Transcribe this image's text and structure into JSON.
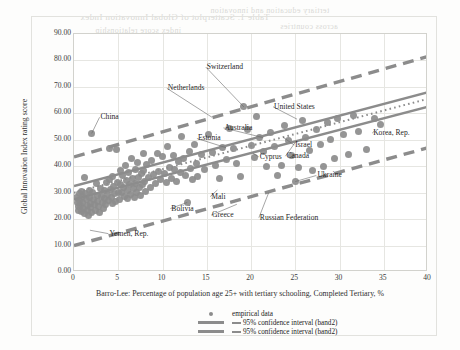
{
  "chart_data": {
    "type": "scatter",
    "title": "",
    "xlabel": "Barro-Lee: Percentage of population age 25+ with tertiary schooling, Completed Tertiary, %",
    "ylabel": "Global Innovation Index rating score",
    "xlim": [
      0,
      40
    ],
    "ylim": [
      0,
      90
    ],
    "xticks": [
      "0",
      "5",
      "10",
      "15",
      "20",
      "25",
      "30",
      "35",
      "40"
    ],
    "yticks": [
      "0.00",
      "10.00",
      "20.00",
      "30.00",
      "40.00",
      "50.00",
      "60.00",
      "70.00",
      "80.00",
      "90.00"
    ],
    "grid": true,
    "legend_position": "bottom-center",
    "marker_color": "#8c8c8c",
    "line_color": "#8c8c8c",
    "legend": [
      {
        "key": "dot",
        "label": "empirical data"
      },
      {
        "key": "line",
        "label": "95% confidence interval (band2)"
      },
      {
        "key": "line",
        "label": "95% confidence interval (band2)"
      }
    ],
    "series": [
      {
        "name": "empirical data",
        "type": "scatter",
        "points": [
          [
            0.3,
            28.0
          ],
          [
            0.4,
            26.2
          ],
          [
            0.5,
            24.6
          ],
          [
            0.5,
            23.4
          ],
          [
            0.6,
            29.5
          ],
          [
            0.6,
            27.1
          ],
          [
            0.7,
            25.3
          ],
          [
            0.8,
            22.8
          ],
          [
            0.9,
            30.4
          ],
          [
            1.0,
            28.6
          ],
          [
            1.0,
            26.4
          ],
          [
            1.1,
            24.1
          ],
          [
            1.2,
            22.2
          ],
          [
            1.2,
            35.6
          ],
          [
            1.3,
            29.8
          ],
          [
            1.4,
            27.3
          ],
          [
            1.5,
            25.0
          ],
          [
            1.5,
            23.2
          ],
          [
            1.6,
            21.3
          ],
          [
            1.7,
            31.0
          ],
          [
            1.8,
            28.2
          ],
          [
            1.9,
            26.0
          ],
          [
            1.9,
            24.4
          ],
          [
            2.0,
            22.6
          ],
          [
            2.0,
            52.4
          ],
          [
            2.1,
            30.1
          ],
          [
            2.2,
            27.6
          ],
          [
            2.3,
            25.5
          ],
          [
            2.4,
            23.1
          ],
          [
            2.5,
            33.3
          ],
          [
            2.6,
            29.0
          ],
          [
            2.7,
            26.8
          ],
          [
            2.8,
            24.9
          ],
          [
            2.9,
            22.4
          ],
          [
            3.0,
            31.6
          ],
          [
            3.1,
            28.4
          ],
          [
            3.2,
            26.1
          ],
          [
            3.3,
            24.2
          ],
          [
            3.4,
            30.8
          ],
          [
            3.5,
            27.9
          ],
          [
            3.6,
            25.6
          ],
          [
            3.7,
            33.8
          ],
          [
            3.8,
            29.2
          ],
          [
            3.9,
            26.9
          ],
          [
            4.0,
            35.1
          ],
          [
            4.0,
            46.6
          ],
          [
            4.1,
            31.2
          ],
          [
            4.2,
            28.1
          ],
          [
            4.3,
            25.9
          ],
          [
            4.4,
            36.0
          ],
          [
            4.5,
            32.5
          ],
          [
            4.6,
            29.6
          ],
          [
            4.7,
            26.5
          ],
          [
            4.8,
            46.2
          ],
          [
            4.9,
            34.0
          ],
          [
            5.0,
            30.2
          ],
          [
            5.1,
            27.4
          ],
          [
            5.2,
            38.2
          ],
          [
            5.3,
            33.1
          ],
          [
            5.4,
            29.9
          ],
          [
            5.5,
            36.4
          ],
          [
            5.6,
            31.8
          ],
          [
            5.7,
            28.7
          ],
          [
            5.8,
            40.1
          ],
          [
            5.9,
            34.6
          ],
          [
            6.0,
            30.9
          ],
          [
            6.1,
            27.8
          ],
          [
            6.2,
            37.6
          ],
          [
            6.3,
            32.9
          ],
          [
            6.4,
            29.3
          ],
          [
            6.5,
            43.1
          ],
          [
            6.6,
            35.3
          ],
          [
            6.7,
            31.4
          ],
          [
            6.8,
            28.3
          ],
          [
            6.9,
            38.9
          ],
          [
            7.0,
            33.6
          ],
          [
            7.1,
            30.0
          ],
          [
            7.2,
            41.4
          ],
          [
            7.3,
            35.9
          ],
          [
            7.4,
            32.1
          ],
          [
            7.5,
            28.9
          ],
          [
            7.6,
            37.1
          ],
          [
            7.7,
            33.0
          ],
          [
            7.8,
            44.8
          ],
          [
            7.9,
            38.4
          ],
          [
            8.0,
            34.3
          ],
          [
            8.1,
            30.6
          ],
          [
            8.2,
            40.6
          ],
          [
            8.4,
            35.7
          ],
          [
            8.6,
            31.9
          ],
          [
            8.8,
            42.2
          ],
          [
            9.0,
            36.8
          ],
          [
            9.2,
            33.4
          ],
          [
            9.4,
            45.0
          ],
          [
            9.6,
            38.0
          ],
          [
            9.8,
            34.8
          ],
          [
            10.0,
            43.6
          ],
          [
            10.2,
            37.2
          ],
          [
            10.4,
            33.7
          ],
          [
            10.6,
            47.3
          ],
          [
            10.8,
            39.4
          ],
          [
            11.0,
            35.2
          ],
          [
            11.2,
            44.2
          ],
          [
            11.4,
            38.6
          ],
          [
            11.6,
            34.4
          ],
          [
            11.8,
            41.8
          ],
          [
            12.0,
            37.8
          ],
          [
            12.2,
            51.3
          ],
          [
            12.4,
            43.0
          ],
          [
            12.6,
            36.6
          ],
          [
            12.8,
            26.3
          ],
          [
            13.0,
            45.6
          ],
          [
            13.2,
            39.0
          ],
          [
            13.4,
            34.9
          ],
          [
            13.6,
            48.2
          ],
          [
            13.8,
            41.0
          ],
          [
            14.0,
            36.2
          ],
          [
            14.4,
            44.4
          ],
          [
            14.8,
            38.8
          ],
          [
            15.2,
            52.1
          ],
          [
            15.6,
            45.2
          ],
          [
            16.0,
            40.2
          ],
          [
            16.4,
            35.5
          ],
          [
            16.8,
            47.0
          ],
          [
            17.2,
            42.6
          ],
          [
            17.6,
            54.2
          ],
          [
            18.0,
            46.8
          ],
          [
            18.4,
            41.2
          ],
          [
            18.8,
            36.1
          ],
          [
            19.2,
            62.4
          ],
          [
            19.6,
            53.9
          ],
          [
            20.0,
            48.0
          ],
          [
            20.4,
            43.4
          ],
          [
            20.6,
            58.8
          ],
          [
            21.0,
            50.8
          ],
          [
            21.4,
            45.4
          ],
          [
            21.8,
            39.8
          ],
          [
            22.2,
            52.6
          ],
          [
            22.6,
            47.4
          ],
          [
            23.0,
            36.5
          ],
          [
            23.4,
            40.4
          ],
          [
            23.8,
            55.4
          ],
          [
            24.2,
            49.6
          ],
          [
            24.6,
            44.0
          ],
          [
            25.0,
            34.2
          ],
          [
            25.4,
            39.6
          ],
          [
            25.8,
            57.2
          ],
          [
            26.2,
            51.0
          ],
          [
            26.6,
            45.8
          ],
          [
            27.0,
            38.3
          ],
          [
            27.4,
            54.0
          ],
          [
            27.8,
            48.4
          ],
          [
            28.2,
            40.0
          ],
          [
            28.6,
            56.6
          ],
          [
            29.0,
            50.2
          ],
          [
            29.4,
            42.8
          ],
          [
            29.8,
            58.2
          ],
          [
            30.4,
            52.0
          ],
          [
            31.0,
            44.6
          ],
          [
            31.6,
            59.2
          ],
          [
            32.2,
            53.2
          ],
          [
            33.0,
            46.4
          ],
          [
            34.0,
            58.0
          ],
          [
            34.6,
            55.8
          ]
        ]
      },
      {
        "name": "95% confidence interval (band2) upper",
        "type": "line-dashed",
        "x": [
          0,
          40
        ],
        "y": [
          43.5,
          81.5
        ]
      },
      {
        "name": "95% confidence interval (band2) lower",
        "type": "line-dashed",
        "x": [
          0,
          40
        ],
        "y": [
          10.0,
          47.0
        ]
      },
      {
        "name": "confidence band upper solid",
        "type": "line-solid",
        "x": [
          0,
          40
        ],
        "y": [
          32.5,
          68.0
        ]
      },
      {
        "name": "confidence band lower solid",
        "type": "line-solid",
        "x": [
          0,
          40
        ],
        "y": [
          27.5,
          62.5
        ]
      },
      {
        "name": "fitted regression",
        "type": "line-dotted",
        "x": [
          0,
          40
        ],
        "y": [
          30.0,
          65.5
        ]
      }
    ],
    "annotations": [
      {
        "text": "China",
        "x": 3.0,
        "y": 58.5,
        "point_x": 2.0,
        "point_y": 52.4
      },
      {
        "text": "Switzerland",
        "x": 15.0,
        "y": 77.5,
        "point_x": 19.2,
        "point_y": 62.4
      },
      {
        "text": "Netherlands",
        "x": 10.6,
        "y": 69.5,
        "point_x": 15.6,
        "point_y": 58.5
      },
      {
        "text": "United States",
        "x": 22.6,
        "y": 62.5,
        "point_x": 25.2,
        "point_y": 57.8
      },
      {
        "text": "Australia",
        "x": 17.0,
        "y": 54.5,
        "point_x": 21.4,
        "point_y": 50.8
      },
      {
        "text": "Estonia",
        "x": 14.0,
        "y": 50.5,
        "point_x": 17.2,
        "point_y": 47.0
      },
      {
        "text": "Israel",
        "x": 25.0,
        "y": 48.0,
        "point_x": 23.6,
        "point_y": 51.0
      },
      {
        "text": "Cyprus",
        "x": 21.0,
        "y": 43.5,
        "point_x": 20.2,
        "point_y": 45.0
      },
      {
        "text": "Canada",
        "x": 24.0,
        "y": 43.8,
        "point_x": 25.0,
        "point_y": 49.0
      },
      {
        "text": "Korea, Rep.",
        "x": 33.8,
        "y": 52.5,
        "point_x": 34.0,
        "point_y": 53.5
      },
      {
        "text": "Ukraine",
        "x": 27.5,
        "y": 36.5,
        "point_x": 25.0,
        "point_y": 34.2
      },
      {
        "text": "Mali",
        "x": 15.5,
        "y": 28.5,
        "point_x": 16.2,
        "point_y": 31.0
      },
      {
        "text": "Bolivia",
        "x": 11.0,
        "y": 24.0,
        "point_x": 12.8,
        "point_y": 26.3
      },
      {
        "text": "Greece",
        "x": 15.6,
        "y": 21.5,
        "point_x": 18.4,
        "point_y": 25.6
      },
      {
        "text": "Russian Federation",
        "x": 21.0,
        "y": 20.5,
        "point_x": 22.0,
        "point_y": 30.0
      },
      {
        "text": "Yemen, Rep.",
        "x": 4.0,
        "y": 14.5,
        "point_x": 1.8,
        "point_y": 15.8
      }
    ]
  },
  "ghost_text": [
    {
      "text": "Table 1. Scatterplot of Global Innovation Index",
      "x": 80,
      "y": 12,
      "size": 9
    },
    {
      "text": "tertiary education and innovation",
      "x": 210,
      "y": 6,
      "size": 8
    },
    {
      "text": "index score relationship",
      "x": 95,
      "y": 26,
      "size": 8
    },
    {
      "text": "across countries",
      "x": 280,
      "y": 22,
      "size": 8
    },
    {
      "text": "data panel",
      "x": 340,
      "y": 38,
      "size": 8
    }
  ]
}
